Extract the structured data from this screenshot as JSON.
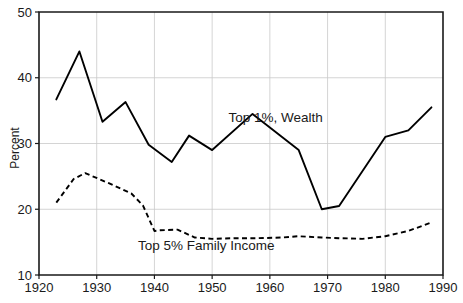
{
  "chart_data": {
    "type": "line",
    "title": "",
    "xlabel": "",
    "ylabel": "Percent",
    "xlim": [
      1920,
      1990
    ],
    "ylim": [
      10,
      50
    ],
    "xticks": [
      1920,
      1930,
      1940,
      1950,
      1960,
      1970,
      1980,
      1990
    ],
    "xtick_labels": [
      "1920",
      "1930",
      "1940",
      "1950",
      "1960",
      "1970",
      "1980",
      "1990"
    ],
    "yticks": [
      10,
      20,
      30,
      40,
      50
    ],
    "ytick_labels": [
      "10",
      "20",
      "30",
      "40",
      "50"
    ],
    "grid": true,
    "grid_color": "#c9c9c9",
    "legend_position": "inline-annotation",
    "background": "#ffffff",
    "axis_color": "#1a1a1a",
    "series": [
      {
        "name": "Top 1%, Wealth",
        "style": "solid",
        "color": "#000000",
        "label_text": "Top 1%, Wealth",
        "label_x": 1961,
        "label_y": 33.2,
        "x": [
          1923,
          1927,
          1931,
          1935,
          1939,
          1943,
          1946,
          1950,
          1957,
          1965,
          1969,
          1972,
          1980,
          1984,
          1988
        ],
        "values": [
          36.7,
          44.0,
          33.3,
          36.3,
          29.8,
          27.2,
          31.2,
          29.0,
          34.5,
          29.0,
          20.0,
          20.5,
          31.0,
          32.0,
          35.5
        ]
      },
      {
        "name": "Top 5% Family Income",
        "style": "dashed",
        "color": "#000000",
        "label_text": "Top 5% Family Income",
        "label_x": 1949,
        "label_y": 13.8,
        "x": [
          1923,
          1926,
          1928,
          1932,
          1936,
          1938,
          1940,
          1941,
          1944,
          1947,
          1950,
          1954,
          1958,
          1962,
          1965,
          1969,
          1972,
          1976,
          1980,
          1984,
          1988
        ],
        "values": [
          21.0,
          24.6,
          25.5,
          24.0,
          22.4,
          20.6,
          16.7,
          16.8,
          16.9,
          15.7,
          15.5,
          15.6,
          15.6,
          15.7,
          15.9,
          15.7,
          15.6,
          15.5,
          15.9,
          16.7,
          18.0
        ]
      }
    ]
  }
}
